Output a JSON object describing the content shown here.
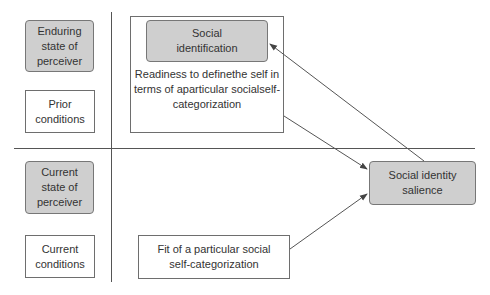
{
  "diagram": {
    "left_column": {
      "enduring_state": "Enduring\nstate of\nperceiver",
      "prior_conditions": "Prior\nconditions",
      "current_state": "Current\nstate of\nperceiver",
      "current_conditions": "Current\nconditions"
    },
    "center": {
      "social_identification": "Social\nidentification",
      "readiness": "Readiness to define\nthe self in terms of a\nparticular social\nself-categorization",
      "fit": "Fit of a particular social\nself-categorization"
    },
    "right": {
      "salience": "Social identity\nsalience"
    },
    "colors": {
      "shaded_fill": "#cfcfcf",
      "line": "#555555",
      "text": "#333333"
    }
  }
}
